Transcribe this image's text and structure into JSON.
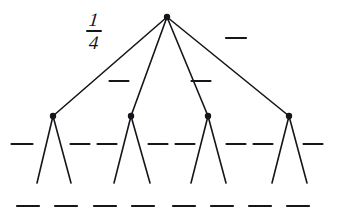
{
  "diagram": {
    "type": "tree-diagram",
    "width": 337,
    "height": 220,
    "background_color": "#ffffff",
    "ink_color": "#15161a",
    "stroke_width": 1.6,
    "node_radius": 3.2
  },
  "labels": {
    "fraction_one_quarter": {
      "numerator": "1",
      "denominator": "4",
      "x": 100,
      "y": 32
    }
  },
  "blank_dashes": {
    "level1": [
      {
        "id": "blank-l1-1",
        "x": 236,
        "y": 38,
        "width": 20
      }
    ],
    "level2": [
      {
        "id": "blank-l2-1",
        "x": 119,
        "y": 81,
        "width": 19
      },
      {
        "id": "blank-l2-2",
        "x": 201,
        "y": 81,
        "width": 19
      }
    ],
    "level3": [
      {
        "id": "blank-l3-1",
        "x": 22,
        "y": 144,
        "width": 21
      },
      {
        "id": "blank-l3-2",
        "x": 80,
        "y": 144,
        "width": 19
      },
      {
        "id": "blank-l3-3",
        "x": 107,
        "y": 144,
        "width": 19
      },
      {
        "id": "blank-l3-4",
        "x": 158,
        "y": 144,
        "width": 19
      },
      {
        "id": "blank-l3-5",
        "x": 185,
        "y": 144,
        "width": 19
      },
      {
        "id": "blank-l3-6",
        "x": 236,
        "y": 144,
        "width": 19
      },
      {
        "id": "blank-l3-7",
        "x": 263,
        "y": 144,
        "width": 19
      },
      {
        "id": "blank-l3-8",
        "x": 313,
        "y": 144,
        "width": 19
      }
    ],
    "outcomes": [
      {
        "id": "blank-outcome-1",
        "x": 28,
        "y": 206,
        "width": 22
      },
      {
        "id": "blank-outcome-2",
        "x": 66,
        "y": 206,
        "width": 22
      },
      {
        "id": "blank-outcome-3",
        "x": 105,
        "y": 206,
        "width": 22
      },
      {
        "id": "blank-outcome-4",
        "x": 143,
        "y": 206,
        "width": 22
      },
      {
        "id": "blank-outcome-5",
        "x": 184,
        "y": 206,
        "width": 22
      },
      {
        "id": "blank-outcome-6",
        "x": 222,
        "y": 206,
        "width": 22
      },
      {
        "id": "blank-outcome-7",
        "x": 260,
        "y": 206,
        "width": 22
      },
      {
        "id": "blank-outcome-8",
        "x": 298,
        "y": 206,
        "width": 22
      }
    ]
  },
  "nodes": {
    "root": {
      "id": "root-node",
      "x": 167,
      "y": 17
    },
    "level2": [
      {
        "id": "node-a",
        "x": 53,
        "y": 116
      },
      {
        "id": "node-b",
        "x": 131,
        "y": 116
      },
      {
        "id": "node-c",
        "x": 208,
        "y": 116
      },
      {
        "id": "node-d",
        "x": 289,
        "y": 116
      }
    ]
  },
  "edges": {
    "from_root": [
      {
        "id": "edge-root-a",
        "x1": 167,
        "y1": 17,
        "x2": 53,
        "y2": 116
      },
      {
        "id": "edge-root-b",
        "x1": 167,
        "y1": 17,
        "x2": 131,
        "y2": 116
      },
      {
        "id": "edge-root-c",
        "x1": 167,
        "y1": 17,
        "x2": 208,
        "y2": 116
      },
      {
        "id": "edge-root-d",
        "x1": 167,
        "y1": 17,
        "x2": 289,
        "y2": 116
      }
    ],
    "to_leaves": [
      {
        "id": "edge-a-left",
        "x1": 53,
        "y1": 116,
        "x2": 37,
        "y2": 183
      },
      {
        "id": "edge-a-right",
        "x1": 53,
        "y1": 116,
        "x2": 71,
        "y2": 183
      },
      {
        "id": "edge-b-left",
        "x1": 131,
        "y1": 116,
        "x2": 114,
        "y2": 183
      },
      {
        "id": "edge-b-right",
        "x1": 131,
        "y1": 116,
        "x2": 150,
        "y2": 183
      },
      {
        "id": "edge-c-left",
        "x1": 208,
        "y1": 116,
        "x2": 191,
        "y2": 183
      },
      {
        "id": "edge-c-right",
        "x1": 208,
        "y1": 116,
        "x2": 226,
        "y2": 183
      },
      {
        "id": "edge-d-left",
        "x1": 289,
        "y1": 116,
        "x2": 272,
        "y2": 183
      },
      {
        "id": "edge-d-right",
        "x1": 289,
        "y1": 116,
        "x2": 307,
        "y2": 183
      }
    ]
  }
}
